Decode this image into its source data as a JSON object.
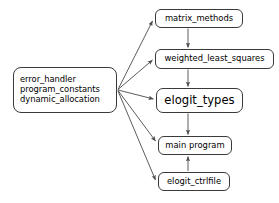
{
  "diagram": {
    "canvas": {
      "width": 279,
      "height": 203,
      "background": "#ffffff"
    },
    "style": {
      "node_border_color": "#3a3a3a",
      "node_fill_color": "#ffffff",
      "edge_color": "#4a4a4a",
      "text_color": "#000000"
    },
    "nodes": {
      "source": {
        "lines": [
          "error_handler",
          "program_constants",
          "dynamic_allocation"
        ]
      },
      "matrix_methods": {
        "label": "matrix_methods"
      },
      "weighted_least_squares": {
        "label": "weighted_least_squares"
      },
      "elogit_types": {
        "label": "elogit_types"
      },
      "main_program": {
        "label": "main program"
      },
      "elogit_ctrlfile": {
        "label": "elogit_ctrlfile"
      }
    },
    "edges": [
      {
        "name": "source-to-matrix-methods",
        "from": "source",
        "to": "matrix_methods",
        "kind": "fan"
      },
      {
        "name": "source-to-weighted-least-squares",
        "from": "source",
        "to": "weighted_least_squares",
        "kind": "fan"
      },
      {
        "name": "source-to-elogit-types",
        "from": "source",
        "to": "elogit_types",
        "kind": "fan"
      },
      {
        "name": "source-to-main-program",
        "from": "source",
        "to": "main_program",
        "kind": "fan"
      },
      {
        "name": "source-to-elogit-ctrlfile",
        "from": "source",
        "to": "elogit_ctrlfile",
        "kind": "fan"
      },
      {
        "name": "matrix-methods-to-weighted-least-squares",
        "from": "matrix_methods",
        "to": "weighted_least_squares",
        "kind": "vertical-down"
      },
      {
        "name": "weighted-least-squares-to-elogit-types",
        "from": "weighted_least_squares",
        "to": "elogit_types",
        "kind": "vertical-down"
      },
      {
        "name": "elogit-types-to-main-program",
        "from": "elogit_types",
        "to": "main_program",
        "kind": "vertical-down"
      },
      {
        "name": "elogit-ctrlfile-to-main-program",
        "from": "elogit_ctrlfile",
        "to": "main_program",
        "kind": "vertical-up"
      }
    ]
  }
}
